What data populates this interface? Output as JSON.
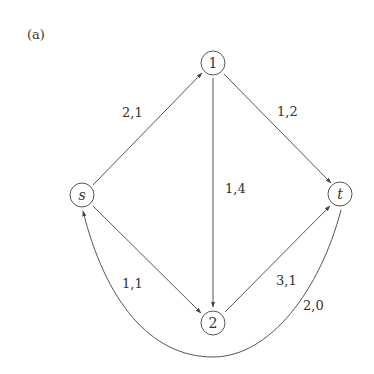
{
  "figure": {
    "caption": "(a)"
  },
  "nodes": [
    {
      "id": "s",
      "label": "s",
      "italic": true,
      "x": 82,
      "y": 195
    },
    {
      "id": "1",
      "label": "1",
      "italic": false,
      "x": 213,
      "y": 63
    },
    {
      "id": "2",
      "label": "2",
      "italic": false,
      "x": 213,
      "y": 323
    },
    {
      "id": "t",
      "label": "t",
      "italic": true,
      "x": 340,
      "y": 194
    }
  ],
  "edges": [
    {
      "from": "s",
      "to": "1",
      "label": "2,1"
    },
    {
      "from": "1",
      "to": "t",
      "label": "1,2"
    },
    {
      "from": "1",
      "to": "2",
      "label": "1,4"
    },
    {
      "from": "s",
      "to": "2",
      "label": "1,1"
    },
    {
      "from": "2",
      "to": "t",
      "label": "3,1"
    },
    {
      "from": "t",
      "to": "s",
      "label": "2,0",
      "curved": true
    }
  ],
  "colors": {
    "stroke": "#555555",
    "text": "#333333",
    "background": "#ffffff"
  }
}
